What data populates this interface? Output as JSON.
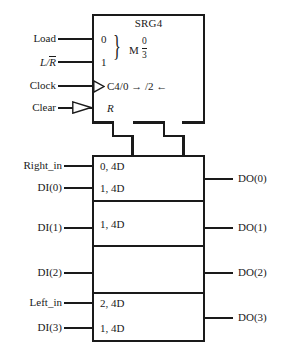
{
  "diagram": {
    "kind": "ieee-shift-register-symbol",
    "control_block": {
      "title": "SRG4",
      "mode_inputs": [
        {
          "label": "Load",
          "qualifier": "0"
        },
        {
          "label": "L/R",
          "label_overbar": "R",
          "qualifier": "1"
        }
      ],
      "mode_letter": "M",
      "mode_range_numerator": "0",
      "mode_range_denominator": "3",
      "clock": {
        "label": "Clock",
        "qualifier": "C4/0 → /2 ←",
        "dynamic_indicator": true
      },
      "clear": {
        "label": "Clear",
        "qualifier": "R",
        "polarity_indicator": true
      }
    },
    "array_block": {
      "rows": [
        {
          "input": "Right_in",
          "qualifier": "0, 4D",
          "output": ""
        },
        {
          "input": "DI(0)",
          "qualifier": "1, 4D",
          "output": "DO(0)"
        },
        {
          "input": "DI(1)",
          "qualifier": "1, 4D",
          "output": "DO(1)"
        },
        {
          "input": "DI(2)",
          "qualifier": "",
          "output": "DO(2)"
        },
        {
          "input": "Left_in",
          "qualifier": "2, 4D",
          "output": ""
        },
        {
          "input": "DI(3)",
          "qualifier": "1, 4D",
          "output": "DO(3)"
        }
      ]
    }
  }
}
